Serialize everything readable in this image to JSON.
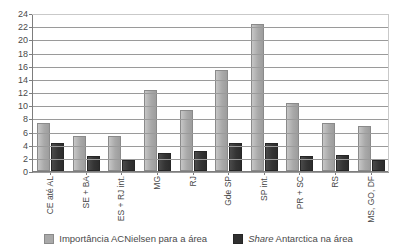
{
  "chart_data": {
    "type": "bar",
    "title": "",
    "xlabel": "",
    "ylabel": "",
    "ylim": [
      0,
      24
    ],
    "ytick_step": 2,
    "yticks": [
      0,
      2,
      4,
      6,
      8,
      10,
      12,
      14,
      16,
      18,
      20,
      22,
      24
    ],
    "grid": true,
    "legend_position": "bottom",
    "categories": [
      "CE até AL",
      "SE + BA",
      "ES + RJ int.",
      "MG",
      "RJ",
      "Gde SP",
      "SP int.",
      "PR + SC",
      "RS",
      "MS, GO, DF"
    ],
    "series": [
      {
        "name": "Importância ACNielsen para a área",
        "color": "#a9a9a9",
        "values": [
          7,
          5,
          5,
          12,
          9,
          15,
          22,
          10,
          7,
          6.5
        ]
      },
      {
        "name": "Share Antarctica na área",
        "color": "#303030",
        "values": [
          4,
          2,
          1.3,
          2.5,
          2.8,
          4,
          4,
          2,
          2.2,
          1.3
        ]
      }
    ]
  },
  "legend": {
    "items": [
      {
        "label": "Importância ACNielsen para a área",
        "swatch": "imp"
      },
      {
        "label": "Share Antarctica na área",
        "swatch": "share",
        "italic_prefix": "Share",
        "rest": " Antarctica na área"
      }
    ]
  }
}
